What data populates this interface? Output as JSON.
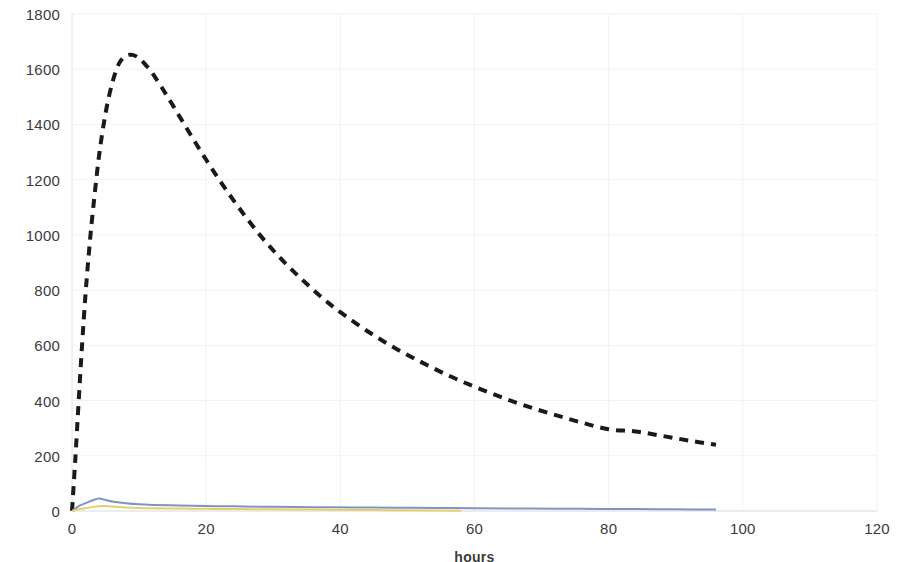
{
  "chart_data": {
    "type": "line",
    "title": "",
    "subtitle": "",
    "xlabel": "hours",
    "ylabel": "",
    "xlim": [
      0,
      120
    ],
    "ylim": [
      0,
      1800
    ],
    "x_ticks": [
      0,
      20,
      40,
      60,
      80,
      100,
      120
    ],
    "y_ticks": [
      0,
      200,
      400,
      600,
      800,
      1000,
      1200,
      1400,
      1600,
      1800
    ],
    "grid": "faint-light-gray-both-axes",
    "legend": "none",
    "legend_position": "none",
    "background_color": "#ffffff",
    "axis_text_color": "#3b3b3b",
    "gridline_color": "#f2f2f2",
    "series": [
      {
        "name": "dashed-black-series",
        "color": "#1a1a1a",
        "style": "dashed",
        "width": 4,
        "x": [
          0,
          0.5,
          1,
          1.5,
          2,
          2.5,
          3,
          4,
          5,
          6,
          7,
          8,
          9,
          10,
          11,
          12,
          14,
          16,
          18,
          20,
          22,
          24,
          26,
          28,
          30,
          32,
          34,
          36,
          38,
          40,
          44,
          48,
          52,
          56,
          60,
          64,
          68,
          72,
          76,
          80,
          84,
          88,
          92,
          96
        ],
        "values": [
          0,
          190,
          400,
          600,
          780,
          930,
          1060,
          1280,
          1440,
          1550,
          1620,
          1648,
          1652,
          1640,
          1615,
          1585,
          1510,
          1430,
          1350,
          1272,
          1198,
          1128,
          1062,
          1000,
          944,
          892,
          845,
          800,
          758,
          720,
          652,
          592,
          540,
          492,
          450,
          412,
          378,
          348,
          320,
          296,
          288,
          272,
          255,
          240
        ]
      },
      {
        "name": "blue-series",
        "color": "#8292c8",
        "style": "solid",
        "width": 2,
        "x": [
          0,
          1,
          2,
          3,
          4,
          5,
          6,
          8,
          10,
          12,
          16,
          20,
          24,
          30,
          36,
          42,
          48,
          54,
          60,
          68,
          76,
          84,
          90,
          96
        ],
        "values": [
          0,
          18,
          28,
          38,
          45,
          40,
          34,
          28,
          24,
          22,
          20,
          18,
          17,
          15,
          14,
          13,
          12,
          11,
          10,
          9,
          8,
          7,
          6,
          5
        ]
      },
      {
        "name": "yellow-series",
        "color": "#e3cf6e",
        "style": "solid",
        "width": 2,
        "x": [
          0,
          1,
          2,
          3,
          4,
          5,
          6,
          8,
          10,
          12,
          16,
          20,
          24,
          30,
          36,
          42,
          48,
          54,
          58
        ],
        "values": [
          0,
          6,
          10,
          14,
          17,
          18,
          16,
          13,
          11,
          10,
          9,
          8,
          7,
          6,
          5,
          4,
          3,
          2,
          1
        ]
      }
    ]
  },
  "axes": {
    "y_tick_labels": [
      "1800",
      "1600",
      "1400",
      "1200",
      "1000",
      "800",
      "600",
      "400",
      "200",
      "0"
    ],
    "x_tick_labels": [
      "0",
      "20",
      "40",
      "60",
      "80",
      "100",
      "120"
    ],
    "x_axis_title": "hours"
  }
}
